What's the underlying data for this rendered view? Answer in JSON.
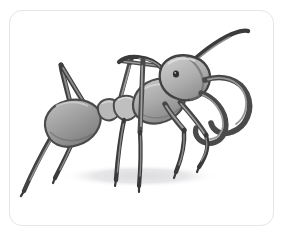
{
  "frame": {
    "border_color": "#e6e6e6",
    "background_color": "#ffffff",
    "corner_radius_px": 13,
    "left_px": 9,
    "top_px": 10,
    "width_px": 265,
    "height_px": 216
  },
  "illustration": {
    "subject": "ant",
    "style": "grayscale pencil drawing",
    "alt_text": "Grayscale pencil illustration of an ant with large curved mandibles, elbowed antennae and six legs, standing with a soft cast shadow",
    "canvas": {
      "width_px": 285,
      "height_px": 238
    },
    "palette": {
      "body_light": "#b9b9b9",
      "body_mid": "#9a9a9a",
      "body_dark": "#6f6f6f",
      "outline": "#3d3d3d",
      "limb_dark": "#4a4a4a",
      "limb_mid": "#7a7a7a",
      "eye": "#2f2f2f",
      "shadow": "#e4e4e6",
      "paper": "#ffffff"
    },
    "parts": [
      {
        "name": "gaster",
        "label": "Abdomen (gaster)",
        "fill": "#a2a2a2"
      },
      {
        "name": "petiole",
        "label": "Petiole nodes",
        "fill": "#b2b2b2"
      },
      {
        "name": "thorax",
        "label": "Thorax (mesosoma)",
        "fill": "#aaaaaa"
      },
      {
        "name": "head",
        "label": "Head",
        "fill": "#b4b4b4"
      },
      {
        "name": "eye",
        "label": "Compound eye",
        "fill": "#2f2f2f"
      },
      {
        "name": "mandible-upper",
        "label": "Upper mandible",
        "fill": "#5e5e5e"
      },
      {
        "name": "mandible-lower",
        "label": "Lower mandible",
        "fill": "#5e5e5e"
      },
      {
        "name": "antenna-right",
        "label": "Right antenna",
        "fill": "#3f3f3f"
      },
      {
        "name": "antenna-left",
        "label": "Left antenna",
        "fill": "#3f3f3f"
      },
      {
        "name": "leg-hind-left",
        "label": "Hind left leg",
        "fill": "#4a4a4a"
      },
      {
        "name": "leg-hind-right",
        "label": "Hind right leg",
        "fill": "#4a4a4a"
      },
      {
        "name": "leg-mid-left",
        "label": "Middle left leg",
        "fill": "#4a4a4a"
      },
      {
        "name": "leg-mid-right",
        "label": "Middle right leg",
        "fill": "#4a4a4a"
      },
      {
        "name": "leg-front-left",
        "label": "Front left leg",
        "fill": "#4a4a4a"
      },
      {
        "name": "leg-front-right",
        "label": "Front right leg",
        "fill": "#4a4a4a"
      },
      {
        "name": "ground-shadow",
        "label": "Cast shadow",
        "fill": "#e4e4e6"
      }
    ]
  }
}
